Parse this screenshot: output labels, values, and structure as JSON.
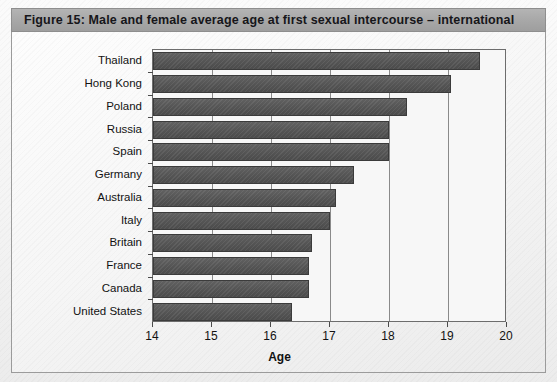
{
  "figure": {
    "caption": "Figure 15:  Male and female average age at first sexual intercourse – international",
    "caption_bar_color": "#a9a9a9",
    "bar_color": "#585858",
    "frame_color": "#6d6d6d"
  },
  "chart_data": {
    "type": "bar",
    "orientation": "horizontal",
    "title": "Figure 15:  Male and female average age at first sexual intercourse – international",
    "xlabel": "Age",
    "ylabel": "",
    "xlim": [
      14,
      20
    ],
    "xticks": [
      14,
      15,
      16,
      17,
      18,
      19,
      20
    ],
    "xtick_labels": [
      "14",
      "15",
      "16",
      "17",
      "18",
      "19",
      "20"
    ],
    "grid": true,
    "grid_axis": "x",
    "legend": null,
    "categories": [
      "Thailand",
      "Hong Kong",
      "Poland",
      "Russia",
      "Spain",
      "Germany",
      "Australia",
      "Italy",
      "Britain",
      "France",
      "Canada",
      "United States"
    ],
    "values": [
      19.55,
      19.05,
      18.3,
      18.0,
      18.0,
      17.4,
      17.1,
      17.0,
      16.7,
      16.65,
      16.65,
      16.35
    ],
    "series": [
      {
        "name": "Average age at first sexual intercourse",
        "values": [
          19.55,
          19.05,
          18.3,
          18.0,
          18.0,
          17.4,
          17.1,
          17.0,
          16.7,
          16.65,
          16.65,
          16.35
        ]
      }
    ]
  }
}
